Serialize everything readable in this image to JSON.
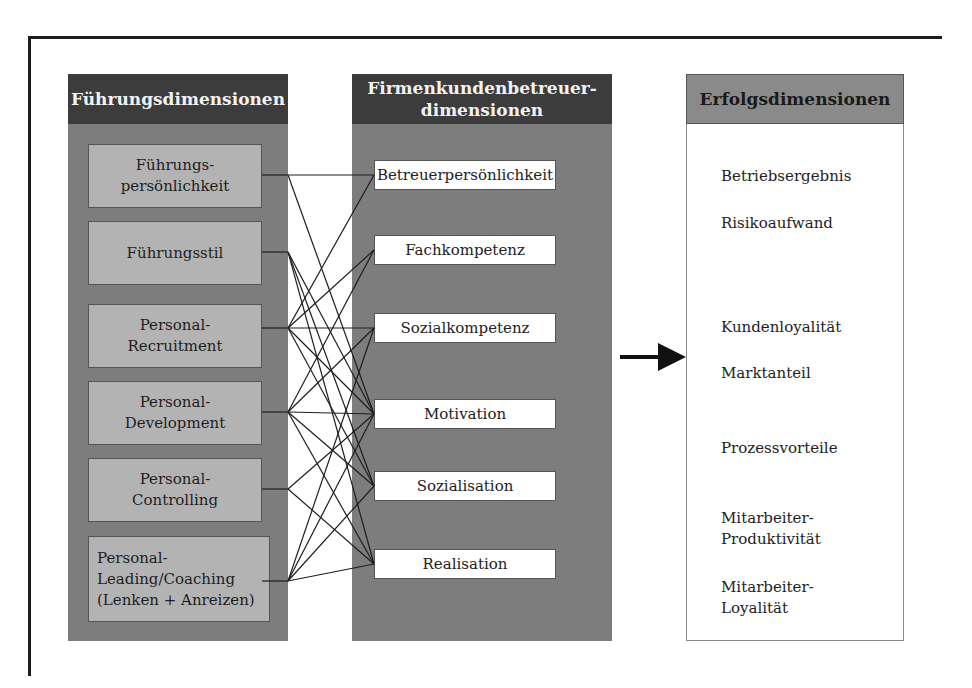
{
  "diagram": {
    "columns": [
      {
        "id": "fuehrung",
        "title": "Führungsdimensionen",
        "items": [
          {
            "label": "Führungs-\npersönlichkeit",
            "anchor_y": 175
          },
          {
            "label": "Führungsstil",
            "anchor_y": 252
          },
          {
            "label": "Personal-\nRecruitment",
            "anchor_y": 328
          },
          {
            "label": "Personal-\nDevelopment",
            "anchor_y": 412
          },
          {
            "label": "Personal-\nControlling",
            "anchor_y": 489
          },
          {
            "label": "Personal-\nLeading/Coaching\n(Lenken + Anreizen)",
            "anchor_y": 581
          }
        ]
      },
      {
        "id": "betreuer",
        "title": "Firmenkundenbetreuer-\ndimensionen",
        "items": [
          {
            "label": "Betreuerpersönlichkeit",
            "anchor_y": 175
          },
          {
            "label": "Fachkompetenz",
            "anchor_y": 250
          },
          {
            "label": "Sozialkompetenz",
            "anchor_y": 328
          },
          {
            "label": "Motivation",
            "anchor_y": 414
          },
          {
            "label": "Sozialisation",
            "anchor_y": 486
          },
          {
            "label": "Realisation",
            "anchor_y": 564
          }
        ]
      },
      {
        "id": "erfolg",
        "title": "Erfolgsdimensionen",
        "items": [
          {
            "label": "Betriebsergebnis"
          },
          {
            "label": "Risikoaufwand"
          },
          {
            "label": "Kundenloyalität"
          },
          {
            "label": "Marktanteil"
          },
          {
            "label": "Prozessvorteile"
          },
          {
            "label": "Mitarbeiter-\nProduktivität"
          },
          {
            "label": "Mitarbeiter-\nLoyalität"
          }
        ]
      }
    ],
    "connections": [
      [
        0,
        0
      ],
      [
        0,
        3
      ],
      [
        1,
        3
      ],
      [
        1,
        4
      ],
      [
        1,
        5
      ],
      [
        2,
        0
      ],
      [
        2,
        1
      ],
      [
        2,
        2
      ],
      [
        2,
        3
      ],
      [
        2,
        4
      ],
      [
        3,
        1
      ],
      [
        3,
        2
      ],
      [
        3,
        3
      ],
      [
        3,
        4
      ],
      [
        3,
        5
      ],
      [
        4,
        3
      ],
      [
        4,
        5
      ],
      [
        5,
        2
      ],
      [
        5,
        3
      ],
      [
        5,
        4
      ],
      [
        5,
        5
      ]
    ],
    "arrow": {
      "direction": "right",
      "from": "betreuer",
      "to": "erfolg"
    },
    "colors": {
      "header_dark": "#3c3c3c",
      "header_light": "#8a8a8a",
      "column_body": "#7d7d7d",
      "left_item_box": "#b3b3b3",
      "mid_item_box": "#ffffff",
      "line": "#1e1e1e"
    }
  }
}
